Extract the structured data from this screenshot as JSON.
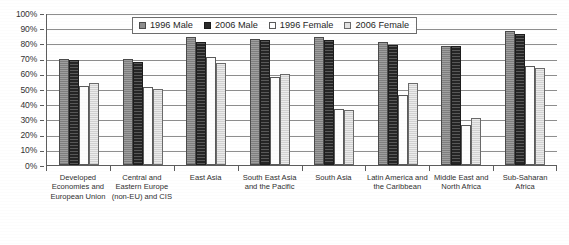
{
  "chart_data": {
    "type": "bar",
    "title": "",
    "xlabel": "",
    "ylabel": "",
    "ylim": [
      0,
      100
    ],
    "ytick_step": 10,
    "grid": true,
    "legend_position": "top-center",
    "value_suffix": "%",
    "categories": [
      "Developed Economies and European Union",
      "Central and Eastern Europe (non-EU) and CIS",
      "East Asia",
      "South East Asia and the Pacific",
      "South Asia",
      "Latin America and the Caribbean",
      "Middle East and North Africa",
      "Sub-Saharan Africa"
    ],
    "ytick_labels": [
      "100%",
      "90%",
      "80%",
      "70%",
      "60%",
      "50%",
      "40%",
      "30%",
      "20%",
      "10%",
      "0%"
    ],
    "series": [
      {
        "name": "1996 Male",
        "key": "s0",
        "color": "#8d8d8d",
        "values": [
          70,
          70,
          84,
          83,
          84,
          81,
          78,
          88
        ]
      },
      {
        "name": "2006 Male",
        "key": "s1",
        "color": "#2f2f2f",
        "values": [
          69,
          68,
          81,
          82,
          82,
          79,
          78,
          86
        ]
      },
      {
        "name": "1996 Female",
        "key": "s2",
        "color": "#ffffff",
        "values": [
          52,
          51,
          71,
          58,
          37,
          46,
          26,
          65
        ]
      },
      {
        "name": "2006 Female",
        "key": "s3",
        "color": "#dcdcdc",
        "values": [
          54,
          50,
          67,
          60,
          36,
          54,
          31,
          64
        ]
      }
    ]
  }
}
